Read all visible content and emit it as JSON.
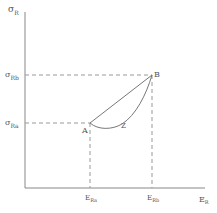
{
  "diagram": {
    "type": "stress-strain sketch",
    "y_axis": {
      "symbol": "σ",
      "subscript": "R"
    },
    "x_axis": {
      "symbol": "E",
      "subscript": "R"
    },
    "y_ticks": [
      {
        "symbol": "σ",
        "subscript": "Rb"
      },
      {
        "symbol": "σ",
        "subscript": "Ra"
      }
    ],
    "x_ticks": [
      {
        "symbol": "E",
        "subscript": "Ra"
      },
      {
        "symbol": "E",
        "subscript": "Rb"
      }
    ],
    "points": [
      {
        "label": "A"
      },
      {
        "label": "B"
      }
    ],
    "curve_label": "Z",
    "colors": {
      "line": "#777777",
      "dash": "#999999",
      "text": "#555555"
    }
  }
}
